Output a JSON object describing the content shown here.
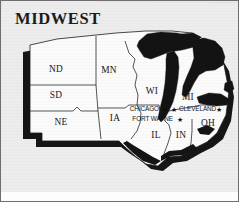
{
  "document": {
    "title": "MIDWEST",
    "type": "printed regional map",
    "background_color": "#ebebeb",
    "frame_color": "#6e6e6e",
    "land_color": "#fafafa",
    "water_color": "#121212",
    "shadow_color": "#111111",
    "border_color": "#262626"
  },
  "map": {
    "region_name": "MIDWEST",
    "states": [
      {
        "code": "ND",
        "name": "North Dakota",
        "label_x": 55,
        "label_y": 71
      },
      {
        "code": "SD",
        "name": "South Dakota",
        "label_x": 55,
        "label_y": 97
      },
      {
        "code": "NE",
        "name": "Nebraska",
        "label_x": 60,
        "label_y": 124
      },
      {
        "code": "MN",
        "name": "Minnesota",
        "label_x": 107,
        "label_y": 72
      },
      {
        "code": "IA",
        "name": "Iowa",
        "label_x": 113,
        "label_y": 119
      },
      {
        "code": "WI",
        "name": "Wisconsin",
        "label_x": 152,
        "label_y": 92
      },
      {
        "code": "MI",
        "name": "Michigan",
        "label_x": 186,
        "label_y": 99
      },
      {
        "code": "IL",
        "name": "Illinois",
        "label_x": 155,
        "label_y": 136
      },
      {
        "code": "IN",
        "name": "Indiana",
        "label_x": 180,
        "label_y": 136
      },
      {
        "code": "OH",
        "name": "Ohio",
        "label_x": 207,
        "label_y": 124
      }
    ],
    "cities": [
      {
        "name": "CHICAGO",
        "label_x": 158,
        "label_y": 109,
        "star_x": 164,
        "star_y": 110,
        "align": "right"
      },
      {
        "name": "CLEVELAND",
        "label_x": 177,
        "label_y": 109,
        "star_x": 172,
        "star_y": 110,
        "align": "left",
        "second_star_x": 218,
        "second_star_y": 110
      },
      {
        "name": "FORT WAYNE",
        "label_x": 172,
        "label_y": 119,
        "star_x": 179,
        "star_y": 120,
        "align": "right"
      }
    ],
    "water_bodies": [
      {
        "name": "Lake Superior"
      },
      {
        "name": "Lake Michigan"
      },
      {
        "name": "Lake Huron"
      },
      {
        "name": "Lake Erie"
      }
    ],
    "star_glyph": "★"
  }
}
